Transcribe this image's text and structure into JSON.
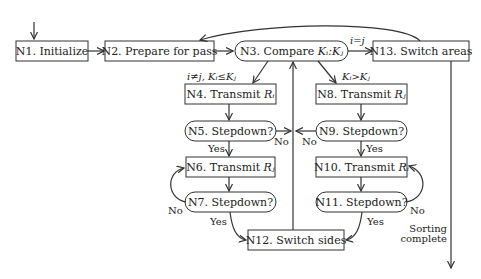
{
  "nodes": {
    "n1": {
      "label": "N1. Initialize"
    },
    "n2": {
      "label": "N2. Prepare for pass"
    },
    "n3": {
      "label": "N3. Compare ",
      "math": "Kᵢ:Kⱼ"
    },
    "n4": {
      "label": "N4. Transmit ",
      "math": "Rᵢ"
    },
    "n5": {
      "label": "N5. Stepdown?"
    },
    "n6": {
      "label": "N6. Transmit ",
      "math": "Rⱼ"
    },
    "n7": {
      "label": "N7. Stepdown?"
    },
    "n8": {
      "label": "N8. Transmit ",
      "math": "Rⱼ"
    },
    "n9": {
      "label": "N9. Stepdown?"
    },
    "n10": {
      "label": "N10. Transmit ",
      "math": "Rᵢ"
    },
    "n11": {
      "label": "N11. Stepdown?"
    },
    "n12": {
      "label": "N12. Switch sides"
    },
    "n13": {
      "label": "N13. Switch areas"
    }
  },
  "edges": {
    "n3_n13": "i=j",
    "n3_n4": "i≠j, Kᵢ≤Kⱼ",
    "n3_n8": "Kᵢ>Kⱼ",
    "n5_yes": "Yes",
    "n5_no": "No",
    "n9_yes": "Yes",
    "n9_no": "No",
    "n7_no": "No",
    "n7_yes": "Yes",
    "n11_no": "No",
    "n11_yes": "Yes",
    "done_1": "Sorting",
    "done_2": "complete"
  }
}
